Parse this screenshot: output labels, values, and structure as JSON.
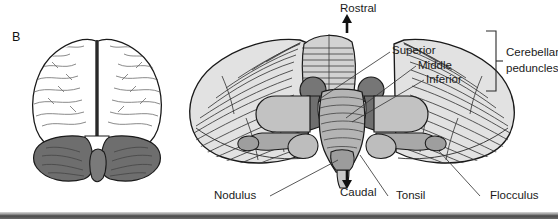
{
  "figure": {
    "panel_letter": "B",
    "background_color": "#ffffff"
  },
  "orientation": {
    "rostral_label": "Rostral",
    "caudal_label": "Caudal",
    "rostral_arrow": "arrow-up-icon",
    "caudal_arrow": "arrow-down-icon"
  },
  "peduncles": {
    "group_label_line1": "Cerebellar",
    "group_label_line2": "peduncles",
    "items": [
      {
        "label": "Superior"
      },
      {
        "label": "Middle"
      },
      {
        "label": "Inferior"
      }
    ]
  },
  "structures": [
    {
      "label": "Nodulus"
    },
    {
      "label": "Tonsil"
    },
    {
      "label": "Flocculus"
    }
  ],
  "brain_inset": {
    "name": "posterior-brain-view",
    "cerebrum_fill": "#ffffff",
    "cerebellum_fill": "#6e6e6e",
    "outline_color": "#1a1a1a"
  },
  "cerebellum_diagram": {
    "name": "cerebellum-dorsal-view",
    "cortex_fill": "#e2e2e2",
    "folia_line_color": "#3a3a3a",
    "brainstem_fill": "#b4b4b4",
    "peduncle_fill": "#8a8a8a",
    "dark_nucleus_fill": "#767676",
    "outline_color": "#1a1a1a"
  },
  "colors": {
    "text": "#1a1a1a",
    "leader_line": "#3a3a3a",
    "bottom_bar": "#4a4a4a"
  }
}
